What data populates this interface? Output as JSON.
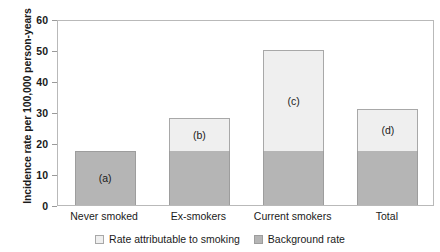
{
  "chart_data": {
    "type": "bar",
    "title": "",
    "subtitle": "",
    "xlabel": "",
    "ylabel": "Incidence rate per 100,000 person-years",
    "ylim": [
      0,
      60
    ],
    "yticks": [
      0,
      10,
      20,
      30,
      40,
      50,
      60
    ],
    "ytick_labels": [
      "0",
      "10",
      "20",
      "30",
      "40",
      "50",
      "60"
    ],
    "grid": false,
    "stacked": true,
    "legend_position": "bottom",
    "categories": [
      "Never smoked",
      "Ex-smokers",
      "Current smokers",
      "Total"
    ],
    "series": [
      {
        "name": "Background rate",
        "color": "#b5b5b5",
        "values": [
          17.5,
          17.5,
          17.5,
          17.5
        ]
      },
      {
        "name": "Rate attributable to smoking",
        "color": "#efefef",
        "values": [
          0,
          10.5,
          32.5,
          13.5
        ]
      }
    ],
    "totals": [
      17.5,
      28,
      50,
      31
    ],
    "annotations": [
      "(a)",
      "(b)",
      "(c)",
      "(d)"
    ]
  },
  "legend": {
    "items": [
      {
        "label": "Rate attributable to smoking",
        "swatch": "attr"
      },
      {
        "label": "Background rate",
        "swatch": "bg"
      }
    ]
  }
}
